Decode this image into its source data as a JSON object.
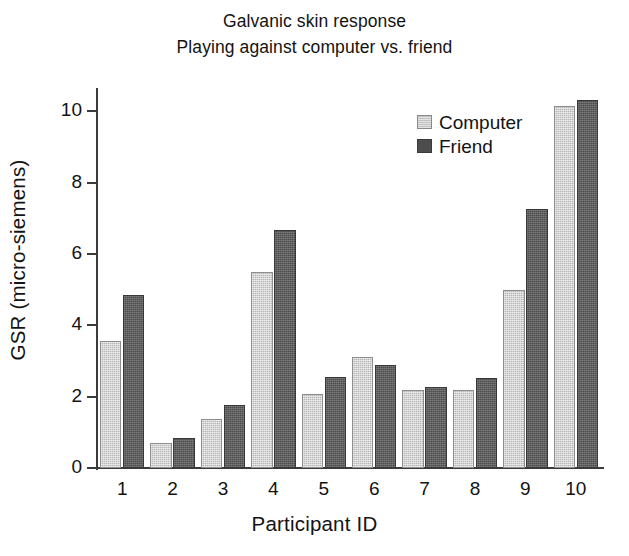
{
  "chart_data": {
    "type": "bar",
    "title": "Galvanic skin response",
    "subtitle": "Playing against computer vs. friend",
    "xlabel": "Participant ID",
    "ylabel": "GSR (micro-siemens)",
    "categories": [
      "1",
      "2",
      "3",
      "4",
      "5",
      "6",
      "7",
      "8",
      "9",
      "10"
    ],
    "series": [
      {
        "name": "Computer",
        "color": "#b6b6b6",
        "values": [
          3.55,
          0.7,
          1.38,
          5.5,
          2.08,
          3.1,
          2.18,
          2.18,
          5.0,
          10.15
        ]
      },
      {
        "name": "Friend",
        "color": "#4d4d4d",
        "values": [
          4.85,
          0.85,
          1.78,
          6.68,
          2.55,
          2.88,
          2.28,
          2.52,
          7.25,
          10.32
        ]
      }
    ],
    "ylim": [
      0,
      10.6
    ],
    "yticks": [
      0,
      2,
      4,
      6,
      8,
      10
    ],
    "ytick_labels": [
      "0",
      "2",
      "4",
      "6",
      "8",
      "10"
    ],
    "grid": false,
    "legend_position": "upper right",
    "legend_entries": [
      "Computer",
      "Friend"
    ]
  }
}
